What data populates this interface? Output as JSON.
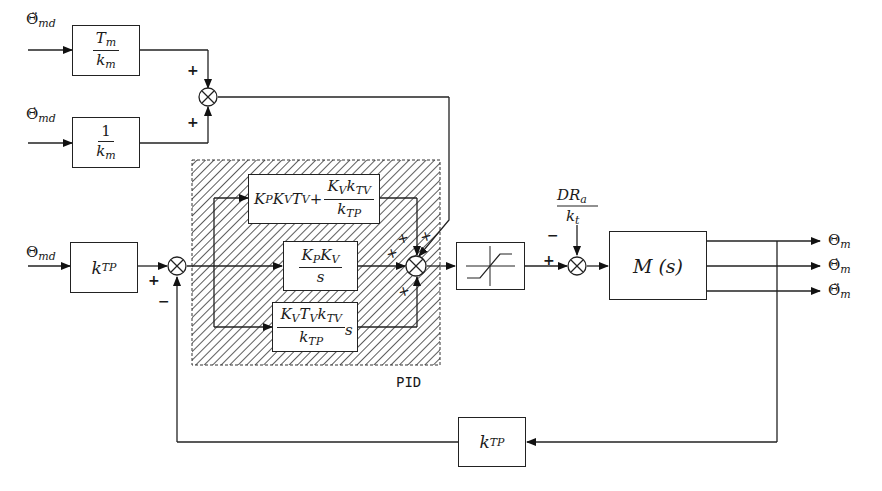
{
  "inputs": {
    "accel_desired": {
      "symbol": "Θ̈",
      "sub": "md"
    },
    "vel_desired": {
      "symbol": "Θ̇",
      "sub": "md"
    },
    "pos_desired": {
      "symbol": "Θ",
      "sub": "md"
    }
  },
  "blocks": {
    "tm_km": {
      "num_main": "T",
      "num_sub": "m",
      "den_main": "k",
      "den_sub": "m"
    },
    "one_km": {
      "num_main": "1",
      "den_main": "k",
      "den_sub": "m"
    },
    "ktp_in": {
      "main": "k",
      "sub": "TP"
    },
    "pid_top": {
      "p1": "K",
      "p1s": "P",
      "p2": "K",
      "p2s": "V",
      "p3": "T",
      "p3s": "V",
      "plus": "+",
      "num1": "K",
      "num1s": "V",
      "num2": "k",
      "num2s": "TV",
      "den": "k",
      "dens": "TP"
    },
    "pid_mid": {
      "num1": "K",
      "num1s": "P",
      "num2": "K",
      "num2s": "V",
      "den": "s"
    },
    "pid_bot": {
      "num1": "K",
      "num1s": "V",
      "num2": "T",
      "num2s": "V",
      "num3": "k",
      "num3s": "TV",
      "tail": "s",
      "den": "k",
      "dens": "TP"
    },
    "plant": {
      "label": "M (s)"
    },
    "ktp_fb": {
      "main": "k",
      "sub": "TP"
    }
  },
  "disturbance": {
    "num": "DR",
    "num_sub": "a",
    "den": "k",
    "den_sub": "t"
  },
  "outputs": [
    {
      "symbol": "Θ",
      "sub": "m"
    },
    {
      "symbol": "Θ̇",
      "sub": "m"
    },
    {
      "symbol": "Θ̈",
      "sub": "m"
    }
  ],
  "signs": {
    "ff_top": "+",
    "ff_bot": "+",
    "err_plus": "+",
    "err_minus": "−",
    "pid_sum": [
      "+",
      "+",
      "+",
      "+"
    ],
    "dist_plus": "+",
    "dist_minus": "−"
  },
  "pid_group_label": "PID",
  "colors": {
    "line": "#222222",
    "hatch": "#333333",
    "background": "#ffffff"
  }
}
